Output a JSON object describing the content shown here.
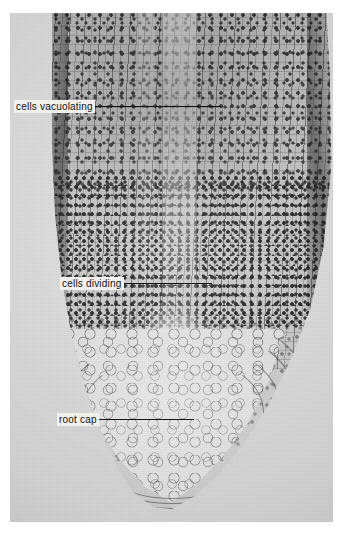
{
  "figure": {
    "type": "photomicrograph",
    "rendering": "black-and-white photographic plate on white page",
    "background_color": "#ffffff",
    "plate_color": "#dedad4"
  },
  "annotations": [
    {
      "id": "cells-vacuolating",
      "label": "cells vacuolating",
      "leader": "horizontal line extending right from label into the elongation zone"
    },
    {
      "id": "cells-dividing",
      "label": "cells dividing",
      "leader": "horizontal line extending right from label into the meristem"
    },
    {
      "id": "root-cap",
      "label": "root cap",
      "leader": "horizontal line extending right from label into the root cap"
    }
  ]
}
